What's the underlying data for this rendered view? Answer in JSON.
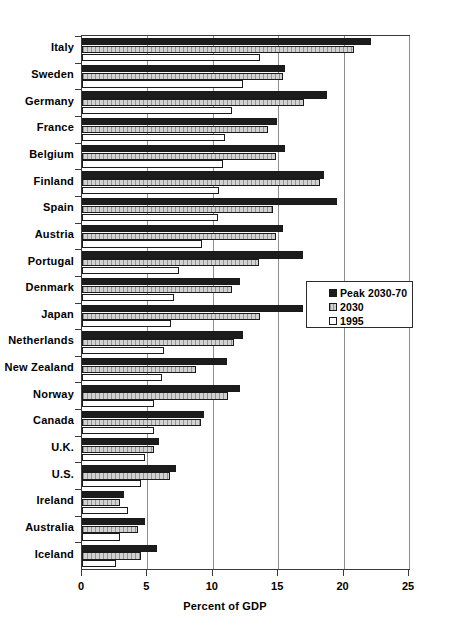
{
  "chart_data": {
    "type": "bar",
    "orientation": "horizontal",
    "title": "",
    "xlabel": "Percent of GDP",
    "ylabel": "",
    "xlim": [
      0,
      25
    ],
    "xticks": [
      0,
      5,
      10,
      15,
      20,
      25
    ],
    "xtick_labels": [
      "0",
      "5",
      "10",
      "15",
      "20",
      "25"
    ],
    "grid": true,
    "legend_position": "center-right",
    "categories": [
      "Italy",
      "Sweden",
      "Germany",
      "France",
      "Belgium",
      "Finland",
      "Spain",
      "Austria",
      "Portugal",
      "Denmark",
      "Japan",
      "Netherlands",
      "New Zealand",
      "Norway",
      "Canada",
      "U.K.",
      "U.S.",
      "Ireland",
      "Australia",
      "Iceland"
    ],
    "series": [
      {
        "name": "Peak 2030-70",
        "color": "#1c1c1c",
        "values": [
          22.1,
          15.5,
          18.7,
          14.9,
          15.5,
          18.5,
          19.5,
          15.4,
          16.9,
          12.1,
          16.9,
          12.3,
          11.1,
          12.1,
          9.3,
          5.9,
          7.2,
          3.2,
          4.8,
          5.7
        ]
      },
      {
        "name": "2030",
        "color": "#d2d2d2",
        "values": [
          20.8,
          15.4,
          17.0,
          14.2,
          14.8,
          18.2,
          14.6,
          14.8,
          13.5,
          11.5,
          13.6,
          11.6,
          8.7,
          11.2,
          9.1,
          5.5,
          6.7,
          2.9,
          4.3,
          4.5
        ]
      },
      {
        "name": "1995",
        "color": "#ffffff",
        "values": [
          13.6,
          12.3,
          11.5,
          10.9,
          10.8,
          10.5,
          10.4,
          9.2,
          7.4,
          7.0,
          6.8,
          6.3,
          6.1,
          5.5,
          5.5,
          4.8,
          4.5,
          3.5,
          2.9,
          2.6
        ]
      }
    ]
  },
  "legend": {
    "items": [
      {
        "label": "Peak 2030-70",
        "swatch": "peak"
      },
      {
        "label": "2030",
        "swatch": "y2030"
      },
      {
        "label": "1995",
        "swatch": "y1995"
      }
    ]
  },
  "axis": {
    "x_title": "Percent of GDP"
  }
}
